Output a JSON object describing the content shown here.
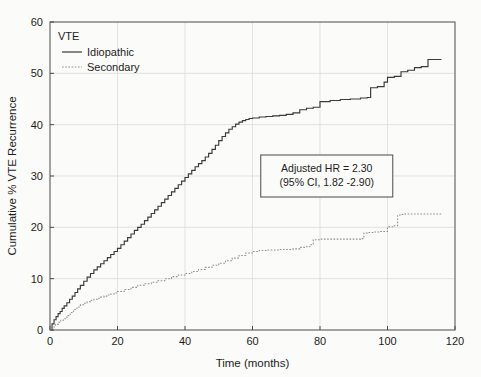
{
  "chart_data": {
    "type": "line",
    "subtype": "kaplan-meier-step",
    "title": "",
    "xlabel": "Time (months)",
    "ylabel": "Cumulative % VTE Recurrence",
    "xlim": [
      0,
      120
    ],
    "ylim": [
      0,
      60
    ],
    "xticks": [
      0,
      20,
      40,
      60,
      80,
      100,
      120
    ],
    "yticks": [
      0,
      10,
      20,
      30,
      40,
      50,
      60
    ],
    "grid": true,
    "legend": {
      "title": "VTE",
      "position": "top-left",
      "entries": [
        {
          "name": "Idiopathic",
          "style": "solid",
          "color": "#3a3a3a"
        },
        {
          "name": "Secondary",
          "style": "dotted",
          "color": "#8d8d8d"
        }
      ]
    },
    "annotations": [
      {
        "name": "hazard-ratio-box",
        "lines": [
          "Adjusted HR = 2.30",
          "(95% CI, 1.82 -2.90)"
        ],
        "x": 82,
        "y": 30
      }
    ],
    "series": [
      {
        "name": "Idiopathic",
        "style": "solid",
        "x": [
          0,
          0.6,
          1.2,
          1.8,
          2.4,
          3.0,
          3.6,
          4.2,
          5.0,
          5.8,
          6.6,
          7.4,
          8.2,
          9.0,
          10.0,
          11.0,
          12.0,
          13.0,
          14.0,
          15.0,
          16.0,
          17.0,
          18.0,
          19.0,
          20.0,
          21.0,
          22.0,
          23.0,
          24.0,
          25.0,
          26.0,
          27.0,
          28.0,
          29.0,
          30.0,
          31.0,
          32.0,
          33.0,
          34.0,
          35.0,
          36.0,
          37.0,
          38.0,
          39.0,
          40.0,
          41.0,
          42.0,
          43.0,
          44.0,
          45.0,
          46.0,
          47.0,
          48.0,
          49.0,
          50.0,
          51.0,
          52.0,
          53.0,
          54.0,
          55.0,
          56.0,
          57.0,
          58.0,
          59.0,
          60.0,
          62.0,
          64.0,
          66.0,
          68.0,
          70.0,
          72.0,
          74.0,
          76.0,
          78.0,
          80.0,
          83.0,
          86.0,
          89.0,
          92.0,
          94.0,
          95.0,
          97.0,
          99.0,
          100.0,
          102.0,
          104.0,
          106.0,
          108.0,
          110.0,
          112.0,
          114.0,
          116.0
        ],
        "y": [
          0.0,
          1.2,
          2.0,
          2.6,
          3.2,
          3.6,
          4.2,
          4.7,
          5.3,
          6.0,
          6.6,
          7.3,
          8.0,
          8.7,
          9.5,
          10.3,
          11.0,
          11.7,
          12.3,
          12.9,
          13.5,
          14.1,
          14.7,
          15.3,
          15.9,
          16.6,
          17.3,
          18.0,
          18.7,
          19.4,
          20.0,
          20.6,
          21.3,
          22.0,
          22.7,
          23.4,
          24.1,
          24.8,
          25.5,
          26.2,
          26.9,
          27.6,
          28.3,
          29.0,
          29.7,
          30.4,
          31.1,
          31.8,
          32.4,
          33.0,
          33.7,
          34.4,
          35.2,
          36.0,
          36.9,
          37.7,
          38.4,
          39.1,
          39.6,
          40.1,
          40.5,
          40.8,
          41.0,
          41.2,
          41.3,
          41.5,
          41.6,
          41.7,
          41.8,
          42.0,
          42.3,
          42.9,
          43.2,
          43.4,
          44.5,
          44.7,
          44.9,
          45.0,
          45.2,
          45.3,
          47.2,
          47.4,
          48.3,
          49.2,
          49.4,
          50.3,
          50.6,
          51.1,
          51.3,
          52.7,
          52.7,
          52.7
        ]
      },
      {
        "name": "Secondary",
        "style": "dotted",
        "x": [
          0,
          0.8,
          1.6,
          2.4,
          3.2,
          4.0,
          5.0,
          6.0,
          7.0,
          8.0,
          9.0,
          10.0,
          11.0,
          12.0,
          13.0,
          14.0,
          15.0,
          16.0,
          17.0,
          18.0,
          19.0,
          20.0,
          22.0,
          24.0,
          26.0,
          28.0,
          30.0,
          32.0,
          34.0,
          36.0,
          38.0,
          40.0,
          42.0,
          44.0,
          46.0,
          48.0,
          50.0,
          52.0,
          54.0,
          56.0,
          58.0,
          60.0,
          62.0,
          64.0,
          66.0,
          68.0,
          70.0,
          72.0,
          74.0,
          76.0,
          77.0,
          78.0,
          80.0,
          84.0,
          88.0,
          92.0,
          93.0,
          94.0,
          96.0,
          98.0,
          100.0,
          102.0,
          103.0,
          104.0,
          105.0,
          108.0,
          112.0,
          116.0
        ],
        "y": [
          0.0,
          0.6,
          1.1,
          1.5,
          1.9,
          2.2,
          2.8,
          3.4,
          4.0,
          4.5,
          4.9,
          5.2,
          5.5,
          5.8,
          6.0,
          6.2,
          6.4,
          6.6,
          6.8,
          7.0,
          7.2,
          7.5,
          7.9,
          8.3,
          8.7,
          9.0,
          9.3,
          9.6,
          10.0,
          10.4,
          10.7,
          11.0,
          11.4,
          11.8,
          12.2,
          12.6,
          13.0,
          13.5,
          14.0,
          14.5,
          15.0,
          15.3,
          15.5,
          15.6,
          15.6,
          15.7,
          15.7,
          15.8,
          16.1,
          16.2,
          16.6,
          17.6,
          17.7,
          17.7,
          17.7,
          17.8,
          18.9,
          19.0,
          19.1,
          19.2,
          20.1,
          20.3,
          22.4,
          22.5,
          22.6,
          22.6,
          22.6,
          22.6
        ]
      }
    ]
  }
}
